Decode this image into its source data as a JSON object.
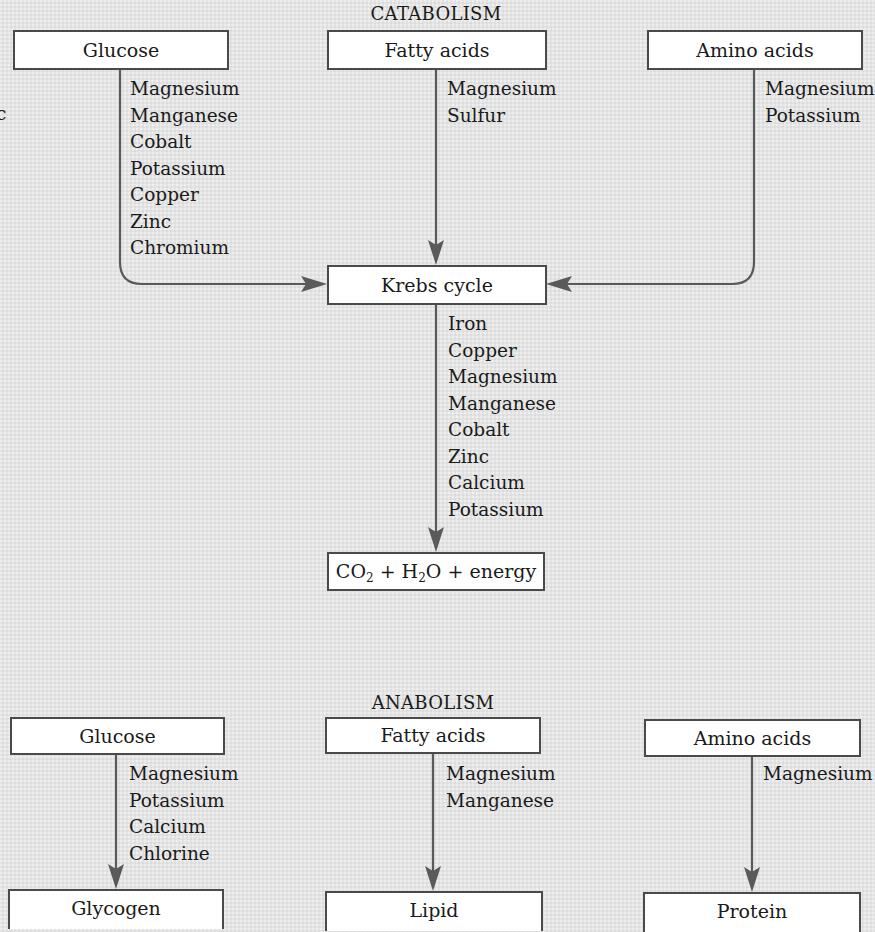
{
  "colors": {
    "background": "#e4e4e4",
    "box_fill": "#ffffff",
    "box_border": "#4a4a4a",
    "connector": "#5a5a5a",
    "text": "#1a1a1a"
  },
  "stray_text": "c",
  "catabolism": {
    "title": "CATABOLISM",
    "sources": [
      {
        "label": "Glucose",
        "cofactors": [
          "Magnesium",
          "Manganese",
          "Cobalt",
          "Potassium",
          "Copper",
          "Zinc",
          "Chromium"
        ]
      },
      {
        "label": "Fatty acids",
        "cofactors": [
          "Magnesium",
          "Sulfur"
        ]
      },
      {
        "label": "Amino acids",
        "cofactors": [
          "Magnesium",
          "Potassium"
        ]
      }
    ],
    "hub": {
      "label": "Krebs cycle",
      "cofactors": [
        "Iron",
        "Copper",
        "Magnesium",
        "Manganese",
        "Cobalt",
        "Zinc",
        "Calcium",
        "Potassium"
      ]
    },
    "product": {
      "parts": [
        "CO",
        "2",
        " + H",
        "2",
        "O + energy"
      ],
      "plain": "CO2 + H2O + energy"
    }
  },
  "anabolism": {
    "title": "ANABOLISM",
    "pathways": [
      {
        "source": "Glucose",
        "cofactors": [
          "Magnesium",
          "Potassium",
          "Calcium",
          "Chlorine"
        ],
        "product": "Glycogen"
      },
      {
        "source": "Fatty acids",
        "cofactors": [
          "Magnesium",
          "Manganese"
        ],
        "product": "Lipid"
      },
      {
        "source": "Amino acids",
        "cofactors": [
          "Magnesium"
        ],
        "product": "Protein"
      }
    ]
  }
}
